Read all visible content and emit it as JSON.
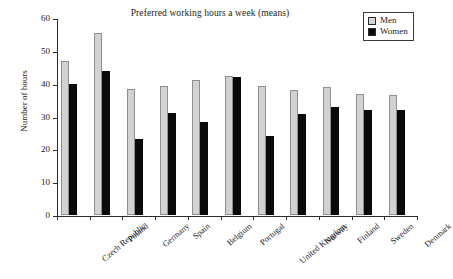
{
  "chart_data": {
    "type": "bar",
    "title": "Preferred working hours a week (means)",
    "xlabel": "",
    "ylabel": "Number of hours",
    "ylim": [
      0,
      60
    ],
    "ytick_step": 10,
    "yticks": [
      0,
      10,
      20,
      30,
      40,
      50,
      60
    ],
    "grid": false,
    "legend_position": "top-right",
    "categories": [
      "Czech Republic",
      "Poland",
      "Germany",
      "Spain",
      "Belgium",
      "Portugal",
      "United Kingdom",
      "Norway",
      "Finland",
      "Sweden",
      "Denmark"
    ],
    "series": [
      {
        "name": "Men",
        "color": "#d2d2d2",
        "values": [
          47.0,
          55.5,
          38.3,
          39.2,
          41.0,
          42.2,
          39.3,
          38.2,
          38.9,
          36.9,
          36.7
        ]
      },
      {
        "name": "Women",
        "color": "#0a0a0a",
        "values": [
          39.8,
          44.0,
          23.0,
          31.0,
          28.2,
          42.0,
          24.0,
          30.8,
          32.9,
          31.9,
          32.1
        ]
      }
    ]
  },
  "legend": {
    "items": [
      {
        "label": "Men",
        "swatch": "men"
      },
      {
        "label": "Women",
        "swatch": "women"
      }
    ]
  }
}
